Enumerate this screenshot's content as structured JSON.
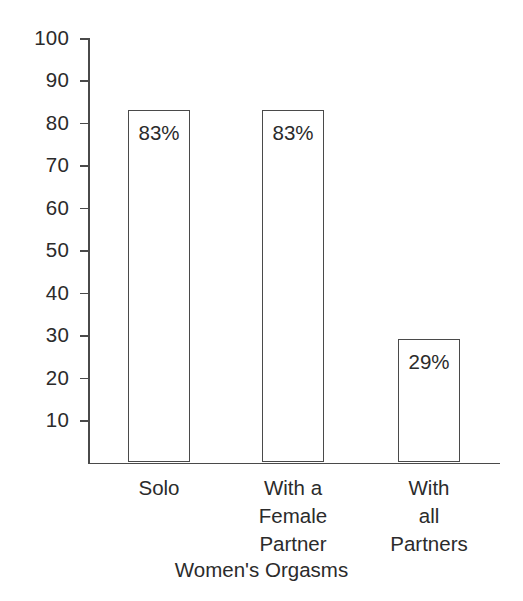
{
  "chart_data": {
    "type": "bar",
    "title": "",
    "xlabel": "Women's Orgasms",
    "ylabel": "",
    "categories": [
      "Solo",
      "With a\nFemale\nPartner",
      "With\nall\nPartners"
    ],
    "values": [
      83,
      83,
      29
    ],
    "value_labels": [
      "83%",
      "83%",
      "29%"
    ],
    "ylim": [
      0,
      100
    ],
    "y_ticks": [
      100,
      90,
      80,
      70,
      60,
      50,
      40,
      30,
      20,
      10
    ],
    "y_tick_labels": [
      "100",
      "90",
      "80",
      "70",
      "60",
      "50",
      "40",
      "30",
      "20",
      "10"
    ],
    "grid": false,
    "legend": null,
    "bar_fill_color": "#ffffff",
    "bar_border_color": "#4a4a4a",
    "axis_color": "#4a4a4a",
    "text_color": "#2b2b2b",
    "background_color": "#ffffff"
  }
}
